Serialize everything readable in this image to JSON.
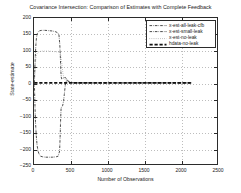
{
  "chart_data": {
    "type": "line",
    "title": "Covariance Intersection: Comparison of Estimates with Complete Feedback",
    "xlabel": "Number of Observations",
    "ylabel": "State-estimate",
    "xlim": [
      0,
      2500
    ],
    "ylim": [
      -250,
      200
    ],
    "xticks": [
      0,
      500,
      1000,
      1500,
      2000,
      2500
    ],
    "yticks": [
      200,
      150,
      100,
      50,
      0,
      -50,
      -100,
      -150,
      -200,
      -250
    ],
    "grid": true,
    "legend_position": "upper-right",
    "series": [
      {
        "name": "x-est-all-leak-cfb",
        "style": "dash-dot",
        "color": "#2b2b2b",
        "points": [
          [
            5,
            0
          ],
          [
            12,
            -60
          ],
          [
            20,
            -118
          ],
          [
            30,
            -160
          ],
          [
            42,
            -192
          ],
          [
            55,
            -210
          ],
          [
            70,
            -220
          ],
          [
            90,
            -226
          ],
          [
            120,
            -228
          ],
          [
            160,
            -229
          ],
          [
            200,
            -229
          ],
          [
            250,
            -229
          ],
          [
            300,
            -228
          ],
          [
            330,
            -226
          ],
          [
            350,
            -210
          ],
          [
            358,
            -160
          ],
          [
            364,
            -110
          ],
          [
            370,
            -80
          ],
          [
            378,
            -72
          ],
          [
            392,
            -70
          ],
          [
            404,
            -55
          ],
          [
            414,
            -36
          ],
          [
            424,
            -14
          ],
          [
            434,
            2
          ],
          [
            448,
            8
          ],
          [
            470,
            5
          ],
          [
            500,
            1
          ],
          [
            560,
            0
          ],
          [
            700,
            0
          ],
          [
            1000,
            0
          ],
          [
            1400,
            0
          ],
          [
            1800,
            0
          ],
          [
            2150,
            0
          ]
        ]
      },
      {
        "name": "x-est-small-leak",
        "style": "dash-dot",
        "color": "#2b2b2b",
        "points": [
          [
            5,
            0
          ],
          [
            14,
            62
          ],
          [
            24,
            112
          ],
          [
            34,
            140
          ],
          [
            46,
            152
          ],
          [
            60,
            158
          ],
          [
            80,
            161
          ],
          [
            110,
            162
          ],
          [
            150,
            162
          ],
          [
            200,
            161
          ],
          [
            250,
            160
          ],
          [
            290,
            158
          ],
          [
            320,
            155
          ],
          [
            340,
            150
          ],
          [
            352,
            120
          ],
          [
            360,
            80
          ],
          [
            366,
            40
          ],
          [
            372,
            18
          ],
          [
            380,
            12
          ],
          [
            396,
            14
          ],
          [
            410,
            16
          ],
          [
            424,
            17
          ],
          [
            440,
            14
          ],
          [
            460,
            7
          ],
          [
            490,
            2
          ],
          [
            540,
            0
          ],
          [
            700,
            0
          ],
          [
            1100,
            0
          ],
          [
            1600,
            0
          ],
          [
            2150,
            0
          ]
        ]
      },
      {
        "name": "x-est-no-leak",
        "style": "dotted",
        "color": "#6e6e6e",
        "points": [
          [
            5,
            0
          ],
          [
            14,
            45
          ],
          [
            24,
            72
          ],
          [
            34,
            86
          ],
          [
            46,
            92
          ],
          [
            60,
            95
          ],
          [
            80,
            97
          ],
          [
            110,
            98
          ],
          [
            150,
            98
          ],
          [
            200,
            98
          ],
          [
            250,
            97
          ],
          [
            300,
            96
          ],
          [
            340,
            95
          ],
          [
            360,
            92
          ],
          [
            380,
            60
          ],
          [
            395,
            30
          ],
          [
            408,
            14
          ],
          [
            424,
            10
          ],
          [
            444,
            6
          ],
          [
            470,
            2
          ],
          [
            510,
            0
          ],
          [
            700,
            0
          ],
          [
            1200,
            0
          ],
          [
            1700,
            0
          ],
          [
            2150,
            0
          ]
        ]
      },
      {
        "name": "hdata-no-leak",
        "style": "heavy-dashed",
        "color": "#111111",
        "points": [
          [
            5,
            0
          ],
          [
            200,
            0
          ],
          [
            500,
            0
          ],
          [
            900,
            0
          ],
          [
            1300,
            0
          ],
          [
            1700,
            0
          ],
          [
            2150,
            0
          ]
        ]
      }
    ]
  },
  "legend": {
    "items": [
      {
        "label": "x-est-all-leak-cfb"
      },
      {
        "label": "x-est-small-leak"
      },
      {
        "label": "x-est-no-leak"
      },
      {
        "label": "hdata-no-leak"
      }
    ]
  }
}
